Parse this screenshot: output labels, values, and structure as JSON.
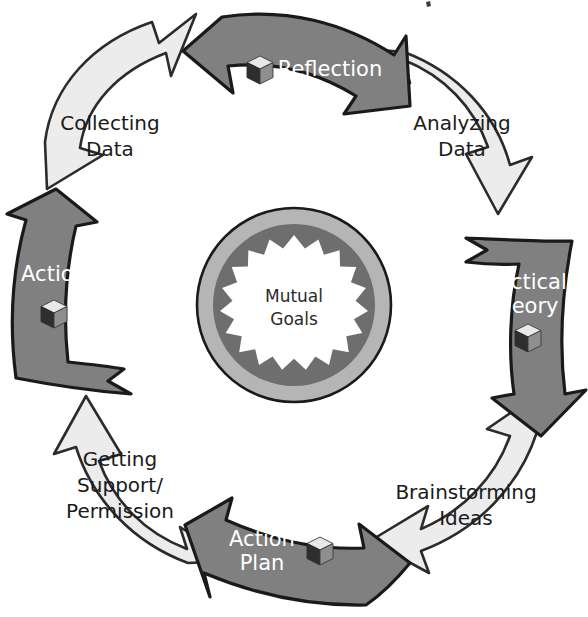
{
  "diagram": {
    "type": "cyclical-process",
    "flow_direction": "clockwise",
    "center": {
      "label_line1": "Mutual",
      "label_line2": "Goals",
      "outer_ring_color": "#b5b5b5",
      "inner_circle_color": "#6e6e6e",
      "starburst_color": "#ffffff",
      "starburst_points": 20
    },
    "palette": {
      "stage_fill": "#808080",
      "stage_text": "#ffffff",
      "transition_fill": "#ececec",
      "transition_text": "#1a1a1a",
      "outline": "#1a1a1a",
      "background": "#ffffff"
    },
    "stages": [
      {
        "id": "reflection",
        "label_lines": [
          "Reflection"
        ],
        "position": "top",
        "kind": "stage",
        "fill": "#808080",
        "text_color": "#ffffff",
        "has_cube_icon": true,
        "icon": "cube-icon"
      },
      {
        "id": "practical-theory",
        "label_lines": [
          "Practical",
          "Theory"
        ],
        "position": "right",
        "kind": "stage",
        "fill": "#808080",
        "text_color": "#ffffff",
        "has_cube_icon": true,
        "icon": "cube-icon"
      },
      {
        "id": "action-plan",
        "label_lines": [
          "Action",
          "Plan"
        ],
        "position": "bottom",
        "kind": "stage",
        "fill": "#808080",
        "text_color": "#ffffff",
        "has_cube_icon": true,
        "icon": "cube-icon"
      },
      {
        "id": "action",
        "label_lines": [
          "Action"
        ],
        "position": "left",
        "kind": "stage",
        "fill": "#808080",
        "text_color": "#ffffff",
        "has_cube_icon": true,
        "icon": "cube-icon"
      }
    ],
    "transitions": [
      {
        "id": "analyzing-data",
        "label_lines": [
          "Analyzing",
          "Data"
        ],
        "position": "top-right",
        "kind": "transition",
        "fill": "#ececec",
        "text_color": "#1a1a1a",
        "has_cube_icon": false
      },
      {
        "id": "brainstorming-ideas",
        "label_lines": [
          "Brainstorming",
          "Ideas"
        ],
        "position": "bottom-right",
        "kind": "transition",
        "fill": "#ececec",
        "text_color": "#1a1a1a",
        "has_cube_icon": false
      },
      {
        "id": "getting-support-permission",
        "label_lines": [
          "Getting",
          "Support/",
          "Permission"
        ],
        "position": "bottom-left",
        "kind": "transition",
        "fill": "#ececec",
        "text_color": "#1a1a1a",
        "has_cube_icon": false
      },
      {
        "id": "collecting-data",
        "label_lines": [
          "Collecting",
          "Data"
        ],
        "position": "top-left",
        "kind": "transition",
        "fill": "#ececec",
        "text_color": "#1a1a1a",
        "has_cube_icon": false
      }
    ],
    "sequence": [
      "Reflection",
      "Analyzing Data",
      "Practical Theory",
      "Brainstorming Ideas",
      "Action Plan",
      "Getting Support/Permission",
      "Action",
      "Collecting Data"
    ]
  }
}
